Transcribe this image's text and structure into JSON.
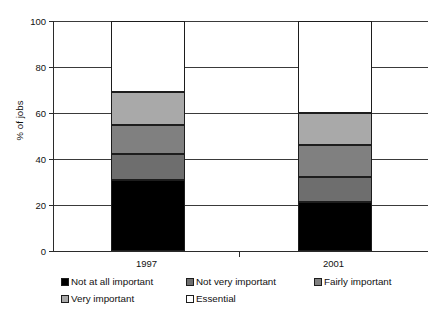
{
  "chart_data": {
    "type": "bar",
    "subtype": "stacked-bar",
    "title": "",
    "xlabel": "",
    "ylabel": "% of jobs",
    "ylim": [
      0,
      100
    ],
    "yticks": [
      0,
      20,
      40,
      60,
      80,
      100
    ],
    "ytick_labels": [
      "0",
      "20",
      "40",
      "60",
      "80",
      "100"
    ],
    "grid": true,
    "grid_axis": "y",
    "legend_position": "bottom",
    "categories": [
      "1997",
      "2001"
    ],
    "series": [
      {
        "name": "Not at all important",
        "color": "#000000",
        "values": [
          31,
          21.5
        ]
      },
      {
        "name": "Not very important",
        "color": "#6e6e6e",
        "values": [
          11,
          10.5
        ]
      },
      {
        "name": "Fairly important",
        "color": "#808080",
        "values": [
          13,
          14
        ]
      },
      {
        "name": "Very important",
        "color": "#a9a9a9",
        "values": [
          14,
          14
        ]
      },
      {
        "name": "Essential",
        "color": "#ffffff",
        "values": [
          31,
          40
        ]
      }
    ]
  },
  "axis": {
    "y_title": "% of jobs"
  }
}
